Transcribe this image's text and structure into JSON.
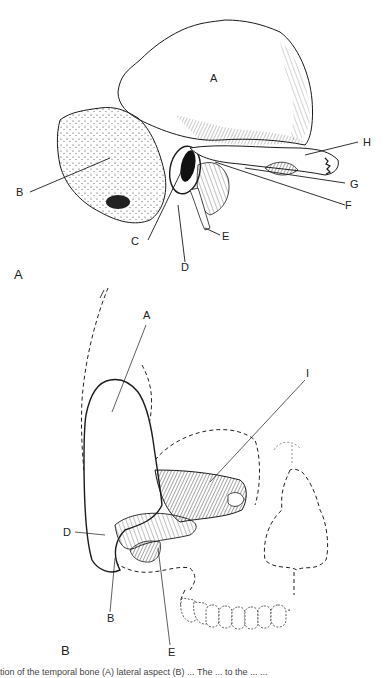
{
  "figure": {
    "panel_a": {
      "panel_label": "A",
      "description": "Temporal bone, lateral view",
      "labels": {
        "A": "A",
        "B": "B",
        "C": "C",
        "D": "D",
        "E": "E",
        "F": "F",
        "G": "G",
        "H": "H"
      }
    },
    "panel_b": {
      "panel_label": "B",
      "description": "Temporal bone in skull outline, with dashed skull, orbit and dentition outlines",
      "labels": {
        "A": "A",
        "B": "B",
        "D": "D",
        "E": "E",
        "I": "I"
      }
    },
    "caption": "tion of the temporal bone (A) lateral aspect (B) ... The ... to the ... ..."
  },
  "colors": {
    "ink": "#1a1a1a",
    "background": "#ffffff",
    "dashed": "#333333"
  }
}
